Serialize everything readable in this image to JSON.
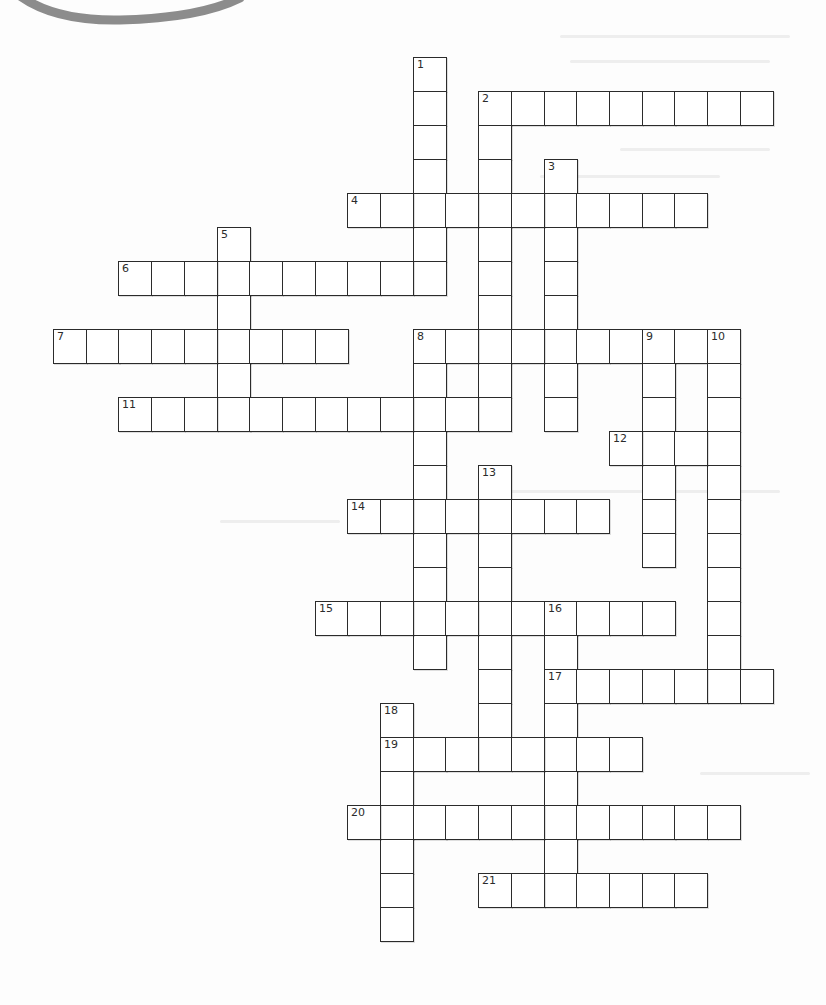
{
  "page": {
    "type": "crossword-puzzle-worksheet",
    "background_color": "#fdfdfd",
    "grid_line_color": "#2b2b2b",
    "decoration_arc_color": "#8c8c8c"
  },
  "grid": {
    "origin_x": 53,
    "origin_y": 57,
    "cell_pitch_x": 32.7,
    "cell_pitch_y": 34,
    "entries": [
      {
        "number": "1",
        "direction": "down",
        "col": 11,
        "row": 0,
        "length": 7
      },
      {
        "number": "2",
        "direction": "across",
        "col": 13,
        "row": 1,
        "length": 9
      },
      {
        "number": "2",
        "direction": "down",
        "col": 13,
        "row": 1,
        "length": 10
      },
      {
        "number": "3",
        "direction": "down",
        "col": 15,
        "row": 3,
        "length": 8
      },
      {
        "number": "4",
        "direction": "across",
        "col": 9,
        "row": 4,
        "length": 11
      },
      {
        "number": "5",
        "direction": "down",
        "col": 5,
        "row": 5,
        "length": 6
      },
      {
        "number": "6",
        "direction": "across",
        "col": 2,
        "row": 6,
        "length": 10
      },
      {
        "number": "7",
        "direction": "across",
        "col": 0,
        "row": 8,
        "length": 9
      },
      {
        "number": "8",
        "direction": "across",
        "col": 11,
        "row": 8,
        "length": 10
      },
      {
        "number": "8",
        "direction": "down",
        "col": 11,
        "row": 8,
        "length": 10
      },
      {
        "number": "9",
        "direction": "down",
        "col": 18,
        "row": 8,
        "length": 7
      },
      {
        "number": "10",
        "direction": "down",
        "col": 20,
        "row": 8,
        "length": 11
      },
      {
        "number": "11",
        "direction": "across",
        "col": 2,
        "row": 10,
        "length": 12
      },
      {
        "number": "12",
        "direction": "across",
        "col": 17,
        "row": 11,
        "length": 4
      },
      {
        "number": "13",
        "direction": "down",
        "col": 13,
        "row": 12,
        "length": 9
      },
      {
        "number": "14",
        "direction": "across",
        "col": 9,
        "row": 13,
        "length": 8
      },
      {
        "number": "15",
        "direction": "across",
        "col": 8,
        "row": 16,
        "length": 11
      },
      {
        "number": "16",
        "direction": "down",
        "col": 15,
        "row": 16,
        "length": 9
      },
      {
        "number": "17",
        "direction": "across",
        "col": 15,
        "row": 18,
        "length": 7
      },
      {
        "number": "18",
        "direction": "down",
        "col": 10,
        "row": 19,
        "length": 7
      },
      {
        "number": "19",
        "direction": "across",
        "col": 10,
        "row": 20,
        "length": 8
      },
      {
        "number": "20",
        "direction": "across",
        "col": 9,
        "row": 22,
        "length": 12
      },
      {
        "number": "21",
        "direction": "across",
        "col": 13,
        "row": 24,
        "length": 7
      }
    ]
  }
}
